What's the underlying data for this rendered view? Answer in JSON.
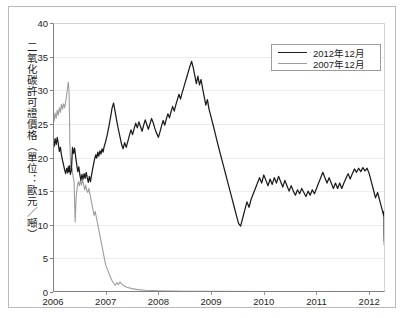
{
  "chart_data": {
    "type": "line",
    "title": "",
    "xlabel": "",
    "ylabel": "二氧化碳許可證價格（單位：歐元／噸）",
    "xlim": [
      2006.0,
      2012.3
    ],
    "ylim": [
      0,
      40
    ],
    "grid": true,
    "legend_position": "top-right",
    "xticks": [
      "2006",
      "2007",
      "2008",
      "2009",
      "2010",
      "2011",
      "2012"
    ],
    "xtick_values": [
      2006,
      2007,
      2008,
      2009,
      2010,
      2011,
      2012
    ],
    "yticks": [
      "0",
      "5",
      "10",
      "15",
      "20",
      "25",
      "30",
      "35",
      "40"
    ],
    "ytick_values": [
      0,
      5,
      10,
      15,
      20,
      25,
      30,
      35,
      40
    ],
    "colors": {
      "series_2012": "#1c1c1c",
      "series_2007": "#9d9d9d",
      "grid": "#ececec",
      "axis": "#808080",
      "text": "#1a1a1a"
    },
    "series": [
      {
        "name": "2012年12月",
        "color": "#1c1c1c",
        "x": [
          2006.0,
          2006.02,
          2006.04,
          2006.06,
          2006.08,
          2006.1,
          2006.12,
          2006.14,
          2006.16,
          2006.18,
          2006.2,
          2006.22,
          2006.24,
          2006.26,
          2006.28,
          2006.29,
          2006.3,
          2006.31,
          2006.33,
          2006.35,
          2006.37,
          2006.39,
          2006.41,
          2006.43,
          2006.45,
          2006.47,
          2006.49,
          2006.51,
          2006.53,
          2006.55,
          2006.57,
          2006.59,
          2006.61,
          2006.63,
          2006.65,
          2006.67,
          2006.69,
          2006.71,
          2006.73,
          2006.75,
          2006.77,
          2006.79,
          2006.81,
          2006.83,
          2006.85,
          2006.87,
          2006.89,
          2006.91,
          2006.93,
          2006.95,
          2006.97,
          2007.0,
          2007.03,
          2007.06,
          2007.09,
          2007.12,
          2007.15,
          2007.18,
          2007.21,
          2007.24,
          2007.27,
          2007.3,
          2007.33,
          2007.36,
          2007.39,
          2007.42,
          2007.45,
          2007.48,
          2007.51,
          2007.54,
          2007.57,
          2007.6,
          2007.63,
          2007.66,
          2007.69,
          2007.72,
          2007.75,
          2007.78,
          2007.81,
          2007.84,
          2007.87,
          2007.9,
          2007.93,
          2007.96,
          2008.0,
          2008.03,
          2008.06,
          2008.09,
          2008.12,
          2008.15,
          2008.18,
          2008.21,
          2008.24,
          2008.27,
          2008.3,
          2008.33,
          2008.36,
          2008.39,
          2008.42,
          2008.45,
          2008.48,
          2008.51,
          2008.54,
          2008.57,
          2008.6,
          2008.63,
          2008.66,
          2008.69,
          2008.72,
          2008.75,
          2008.78,
          2008.81,
          2008.84,
          2008.87,
          2008.9,
          2008.93,
          2008.96,
          2009.0,
          2009.04,
          2009.08,
          2009.12,
          2009.16,
          2009.2,
          2009.24,
          2009.28,
          2009.32,
          2009.36,
          2009.4,
          2009.44,
          2009.48,
          2009.52,
          2009.56,
          2009.6,
          2009.64,
          2009.68,
          2009.72,
          2009.76,
          2009.8,
          2009.84,
          2009.88,
          2009.92,
          2009.96,
          2010.0,
          2010.04,
          2010.08,
          2010.12,
          2010.16,
          2010.2,
          2010.24,
          2010.28,
          2010.32,
          2010.36,
          2010.4,
          2010.44,
          2010.48,
          2010.52,
          2010.56,
          2010.6,
          2010.64,
          2010.68,
          2010.72,
          2010.76,
          2010.8,
          2010.84,
          2010.88,
          2010.92,
          2010.96,
          2011.0,
          2011.04,
          2011.08,
          2011.12,
          2011.16,
          2011.2,
          2011.24,
          2011.28,
          2011.32,
          2011.36,
          2011.4,
          2011.44,
          2011.48,
          2011.52,
          2011.56,
          2011.6,
          2011.64,
          2011.68,
          2011.72,
          2011.76,
          2011.8,
          2011.84,
          2011.88,
          2011.92,
          2011.96,
          2012.0,
          2012.04,
          2012.08,
          2012.12,
          2012.16,
          2012.2,
          2012.24,
          2012.28
        ],
        "y": [
          22.2,
          21.6,
          22.8,
          21.9,
          23.0,
          22.1,
          20.9,
          21.5,
          20.4,
          19.6,
          18.9,
          18.2,
          17.6,
          18.4,
          17.7,
          18.6,
          17.9,
          18.8,
          17.5,
          18.2,
          21.5,
          20.6,
          21.4,
          20.1,
          19.0,
          17.9,
          18.6,
          17.4,
          16.6,
          17.5,
          16.8,
          17.6,
          16.9,
          17.8,
          17.0,
          16.3,
          17.2,
          16.4,
          17.3,
          18.2,
          19.0,
          19.8,
          20.4,
          19.9,
          20.8,
          20.2,
          21.0,
          20.5,
          21.3,
          20.8,
          21.6,
          22.4,
          23.4,
          24.6,
          25.9,
          27.3,
          28.1,
          26.8,
          25.4,
          24.2,
          23.1,
          22.0,
          21.3,
          22.2,
          21.5,
          22.4,
          23.3,
          24.1,
          23.4,
          24.3,
          25.1,
          24.4,
          25.3,
          24.6,
          23.9,
          24.8,
          25.6,
          24.9,
          24.2,
          25.0,
          25.8,
          25.2,
          24.4,
          23.7,
          23.0,
          23.8,
          24.7,
          25.5,
          24.8,
          25.7,
          26.5,
          25.9,
          26.8,
          27.6,
          26.9,
          27.8,
          28.6,
          29.4,
          28.7,
          29.6,
          30.4,
          31.2,
          32.0,
          32.8,
          33.6,
          34.3,
          33.4,
          32.2,
          31.0,
          32.1,
          30.8,
          31.6,
          30.2,
          29.0,
          27.8,
          28.6,
          27.2,
          26.0,
          24.8,
          23.5,
          22.2,
          21.0,
          19.8,
          18.6,
          17.4,
          16.2,
          15.0,
          13.8,
          12.6,
          11.4,
          10.2,
          9.8,
          11.0,
          12.2,
          13.4,
          12.6,
          13.8,
          14.6,
          15.4,
          16.2,
          17.0,
          16.2,
          17.4,
          16.6,
          15.8,
          16.8,
          16.0,
          17.0,
          16.2,
          17.2,
          16.4,
          15.6,
          16.6,
          15.8,
          15.0,
          15.8,
          15.0,
          14.4,
          15.2,
          14.6,
          15.4,
          14.8,
          14.2,
          15.0,
          14.4,
          15.2,
          14.6,
          15.4,
          16.2,
          17.0,
          17.8,
          17.0,
          16.2,
          17.0,
          16.2,
          15.4,
          16.2,
          15.4,
          16.2,
          15.4,
          16.2,
          16.9,
          17.6,
          16.8,
          17.6,
          18.3,
          17.8,
          18.4,
          17.9,
          18.5,
          18.0,
          18.4,
          17.6,
          16.4,
          15.2,
          14.0,
          14.8,
          13.6,
          12.4,
          11.2
        ],
        "y_tail": [
          12.0,
          10.8,
          9.6,
          8.4,
          8.8,
          7.6,
          8.4,
          7.8,
          8.6,
          7.4,
          8.2,
          7.0,
          7.8,
          7.2,
          8.0,
          7.4,
          8.2,
          7.6,
          8.4,
          7.8,
          7.2,
          8.0,
          7.4,
          8.2,
          7.6,
          8.3,
          7.7,
          8.1
        ]
      },
      {
        "name": "2007年12月",
        "color": "#9d9d9d",
        "x": [
          2006.0,
          2006.02,
          2006.04,
          2006.06,
          2006.08,
          2006.1,
          2006.12,
          2006.14,
          2006.16,
          2006.18,
          2006.2,
          2006.22,
          2006.24,
          2006.26,
          2006.28,
          2006.29,
          2006.3,
          2006.31,
          2006.32,
          2006.34,
          2006.36,
          2006.38,
          2006.4,
          2006.42,
          2006.44,
          2006.46,
          2006.48,
          2006.5,
          2006.52,
          2006.54,
          2006.56,
          2006.58,
          2006.6,
          2006.62,
          2006.64,
          2006.66,
          2006.68,
          2006.7,
          2006.72,
          2006.74,
          2006.76,
          2006.78,
          2006.8,
          2006.82,
          2006.84,
          2006.86,
          2006.88,
          2006.9,
          2006.92,
          2006.94,
          2006.96,
          2006.98,
          2007.0,
          2007.03,
          2007.06,
          2007.09,
          2007.12,
          2007.15,
          2007.18,
          2007.21,
          2007.24,
          2007.27,
          2007.3,
          2007.35,
          2007.4,
          2007.5,
          2007.6,
          2007.75,
          2008.0,
          2008.5,
          2009.0,
          2010.0,
          2011.0,
          2012.0,
          2012.28
        ],
        "y": [
          26.2,
          25.4,
          26.6,
          25.8,
          27.0,
          26.3,
          27.4,
          26.7,
          27.9,
          27.2,
          28.0,
          27.4,
          28.2,
          29.4,
          30.6,
          31.2,
          30.4,
          28.0,
          22.0,
          17.8,
          18.4,
          17.2,
          16.4,
          10.4,
          14.2,
          15.6,
          16.4,
          15.8,
          16.6,
          15.9,
          16.8,
          16.0,
          15.2,
          15.9,
          15.1,
          14.8,
          15.4,
          14.6,
          13.8,
          13.0,
          12.2,
          11.4,
          12.0,
          11.2,
          10.4,
          9.6,
          8.8,
          8.0,
          7.2,
          6.4,
          5.6,
          4.8,
          4.0,
          3.4,
          2.8,
          2.2,
          1.7,
          1.3,
          1.0,
          1.4,
          1.1,
          1.5,
          1.2,
          0.9,
          0.7,
          0.5,
          0.35,
          0.25,
          0.18,
          0.12,
          0.09,
          0.06,
          0.05,
          0.04,
          0.04
        ]
      }
    ]
  },
  "legend": {
    "items": [
      {
        "label": "2012年12月",
        "style": "dark"
      },
      {
        "label": "2007年12月",
        "style": "gray"
      }
    ]
  },
  "axis": {
    "y_caption": "二氧化碳許可證價格（單位：歐元／噸）"
  }
}
